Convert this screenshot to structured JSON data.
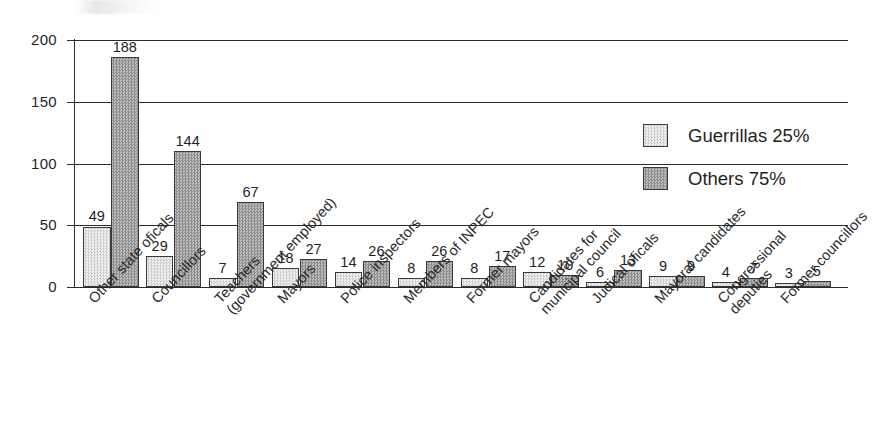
{
  "chart_data": {
    "type": "bar",
    "title": "",
    "xlabel": "",
    "ylabel": "",
    "ylim": [
      0,
      200
    ],
    "yticks": [
      0,
      50,
      100,
      150,
      200
    ],
    "grid": true,
    "legend_position": "right-inside",
    "categories": [
      "Other state oficals",
      "Councillors",
      "Teachers (government employed)",
      "Mayors",
      "Police inspectors",
      "Members of INPEC",
      "Former mayors",
      "Candidates for municipal council",
      "Judical oficals",
      "Mayoral candidates",
      "Congressional deputies",
      "Former councillors"
    ],
    "category_lines": [
      [
        "Other state oficals"
      ],
      [
        "Councillors"
      ],
      [
        "Teachers",
        "(government employed)"
      ],
      [
        "Mayors"
      ],
      [
        "Police inspectors"
      ],
      [
        "Members of INPEC"
      ],
      [
        "Former mayors"
      ],
      [
        "Candidates for",
        "municipal council"
      ],
      [
        "Judical oficals"
      ],
      [
        "Mayoral candidates"
      ],
      [
        "Congressional",
        "deputies"
      ],
      [
        "Former councillors"
      ]
    ],
    "series": [
      {
        "name": "Guerrillas 25%",
        "color": "#e8e8e8",
        "values": [
          49,
          29,
          7,
          18,
          14,
          8,
          8,
          12,
          6,
          9,
          4,
          3
        ],
        "plotted": [
          49,
          25,
          7,
          15,
          12,
          7,
          7,
          12,
          4,
          9,
          4,
          3
        ]
      },
      {
        "name": "Others 75%",
        "color": "#a8a8a8",
        "values": [
          188,
          144,
          67,
          27,
          26,
          26,
          17,
          10,
          13,
          9,
          7,
          5
        ],
        "plotted": [
          186,
          110,
          69,
          23,
          21,
          21,
          17,
          10,
          14,
          9,
          7,
          5
        ]
      }
    ]
  },
  "axis": {
    "tick_labels": [
      "200",
      "150",
      "100",
      "50",
      "0"
    ]
  },
  "legend": {
    "items": [
      {
        "label": "Guerrillas 25%",
        "swatch": "light"
      },
      {
        "label": "Others 75%",
        "swatch": "dark"
      }
    ]
  }
}
